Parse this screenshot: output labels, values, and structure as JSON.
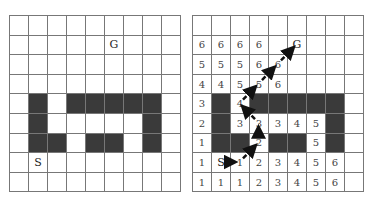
{
  "grid": {
    "rows": 9,
    "cols": 9,
    "walls": [
      [
        4,
        1
      ],
      [
        4,
        3
      ],
      [
        4,
        4
      ],
      [
        4,
        5
      ],
      [
        4,
        6
      ],
      [
        4,
        7
      ],
      [
        5,
        1
      ],
      [
        5,
        7
      ],
      [
        6,
        1
      ],
      [
        6,
        2
      ],
      [
        6,
        4
      ],
      [
        6,
        5
      ],
      [
        6,
        7
      ]
    ],
    "start": {
      "row": 7,
      "col": 1,
      "label": "S"
    },
    "goal": {
      "row": 1,
      "col": 5,
      "label": "G"
    }
  },
  "left_panel": {
    "cells": [
      [
        "",
        "",
        "",
        "",
        "",
        "",
        "",
        "",
        ""
      ],
      [
        "",
        "",
        "",
        "",
        "",
        "G",
        "",
        "",
        ""
      ],
      [
        "",
        "",
        "",
        "",
        "",
        "",
        "",
        "",
        ""
      ],
      [
        "",
        "",
        "",
        "",
        "",
        "",
        "",
        "",
        ""
      ],
      [
        "",
        "",
        "",
        "",
        "",
        "",
        "",
        "",
        ""
      ],
      [
        "",
        "",
        "",
        "",
        "",
        "",
        "",
        "",
        ""
      ],
      [
        "",
        "",
        "",
        "",
        "",
        "",
        "",
        "",
        ""
      ],
      [
        "",
        "S",
        "",
        "",
        "",
        "",
        "",
        "",
        ""
      ],
      [
        "",
        "",
        "",
        "",
        "",
        "",
        "",
        "",
        ""
      ]
    ]
  },
  "right_panel": {
    "cells": [
      [
        "",
        "",
        "",
        "",
        "",
        "",
        "",
        "",
        ""
      ],
      [
        "6",
        "6",
        "6",
        "6",
        "",
        "G",
        "",
        "",
        ""
      ],
      [
        "5",
        "5",
        "5",
        "6",
        "6",
        "",
        "",
        "",
        ""
      ],
      [
        "4",
        "4",
        "5",
        "5",
        "6",
        "",
        "",
        "",
        ""
      ],
      [
        "3",
        "",
        "4",
        "",
        "",
        "",
        "",
        "",
        ""
      ],
      [
        "2",
        "",
        "3",
        "3",
        "3",
        "4",
        "5",
        "",
        ""
      ],
      [
        "1",
        "",
        "",
        "2",
        "",
        "",
        "5",
        "",
        ""
      ],
      [
        "1",
        "S",
        "1",
        "2",
        "3",
        "4",
        "5",
        "6",
        ""
      ],
      [
        "1",
        "1",
        "1",
        "2",
        "3",
        "4",
        "5",
        "6",
        ""
      ]
    ],
    "path": [
      [
        7,
        1
      ],
      [
        7,
        2
      ],
      [
        6,
        3
      ],
      [
        5,
        3
      ],
      [
        4,
        2
      ],
      [
        3,
        3
      ],
      [
        2,
        4
      ],
      [
        1,
        5
      ]
    ],
    "arrow_color": "#111111"
  },
  "colors": {
    "wall": "#3a3a3a",
    "grid_line": "#777777"
  }
}
